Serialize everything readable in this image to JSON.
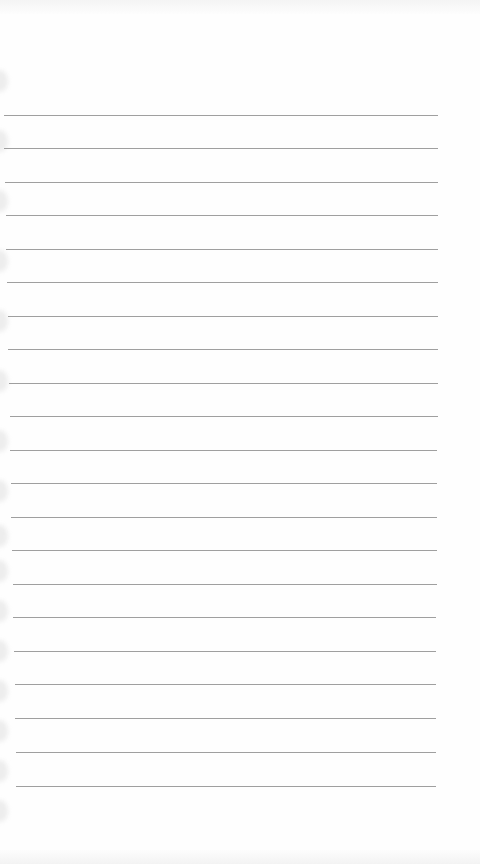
{
  "page": {
    "type": "lined-notebook-paper",
    "background_color": "#fefefe",
    "rule_color": "#8e8e8e",
    "rules": [
      {
        "y": 115,
        "x1": 4,
        "x2": 438
      },
      {
        "y": 148,
        "x1": 4,
        "x2": 438
      },
      {
        "y": 182,
        "x1": 5,
        "x2": 438
      },
      {
        "y": 215,
        "x1": 6,
        "x2": 438
      },
      {
        "y": 249,
        "x1": 6,
        "x2": 438
      },
      {
        "y": 282,
        "x1": 7,
        "x2": 438
      },
      {
        "y": 316,
        "x1": 8,
        "x2": 438
      },
      {
        "y": 349,
        "x1": 8,
        "x2": 438
      },
      {
        "y": 383,
        "x1": 9,
        "x2": 438
      },
      {
        "y": 416,
        "x1": 10,
        "x2": 438
      },
      {
        "y": 450,
        "x1": 10,
        "x2": 437
      },
      {
        "y": 483,
        "x1": 11,
        "x2": 437
      },
      {
        "y": 517,
        "x1": 11,
        "x2": 437
      },
      {
        "y": 550,
        "x1": 12,
        "x2": 437
      },
      {
        "y": 584,
        "x1": 13,
        "x2": 437
      },
      {
        "y": 617,
        "x1": 13,
        "x2": 436
      },
      {
        "y": 651,
        "x1": 14,
        "x2": 436
      },
      {
        "y": 684,
        "x1": 15,
        "x2": 436
      },
      {
        "y": 718,
        "x1": 15,
        "x2": 436
      },
      {
        "y": 752,
        "x1": 16,
        "x2": 436
      },
      {
        "y": 786,
        "x1": 16,
        "x2": 436
      }
    ],
    "perforations_y": [
      70,
      130,
      190,
      250,
      310,
      370,
      430,
      480,
      525,
      560,
      600,
      640,
      680,
      720,
      760,
      800
    ]
  }
}
